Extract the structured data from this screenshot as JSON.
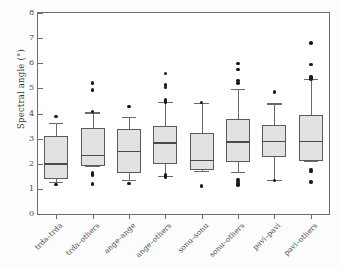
{
  "chart_data": {
    "type": "box",
    "title": "",
    "xlabel": "",
    "ylabel": "Spectral angle (°)",
    "ylim": [
      0,
      8
    ],
    "yticks": [
      0,
      1,
      2,
      3,
      4,
      5,
      6,
      7,
      8
    ],
    "ytick_labels": [
      "0",
      "1",
      "2",
      "3",
      "4",
      "5",
      "6",
      "7",
      "8"
    ],
    "grid": false,
    "legend": "none",
    "categories": [
      "trda–trda",
      "trda–others",
      "ange–ange",
      "ange–others",
      "sonu–sonu",
      "sonu–others",
      "pavi–pavi",
      "pavi–others"
    ],
    "boxes": [
      {
        "category": "trda–trda",
        "whisker_low": 1.26,
        "q1": 1.4,
        "median": 2.01,
        "q3": 3.12,
        "whisker_high": 3.64,
        "outliers": [
          3.88,
          1.17
        ]
      },
      {
        "category": "trda–others",
        "whisker_low": 1.92,
        "q1": 1.93,
        "median": 2.34,
        "q3": 3.44,
        "whisker_high": 4.04,
        "outliers": [
          5.22,
          4.93,
          4.07,
          1.66,
          1.6,
          1.55,
          1.2
        ]
      },
      {
        "category": "ange–ange",
        "whisker_low": 1.35,
        "q1": 1.62,
        "median": 2.51,
        "q3": 3.39,
        "whisker_high": 3.85,
        "outliers": [
          4.28,
          1.22
        ]
      },
      {
        "category": "ange–others",
        "whisker_low": 1.5,
        "q1": 1.98,
        "median": 2.85,
        "q3": 3.52,
        "whisker_high": 4.45,
        "outliers": [
          5.6,
          5.13,
          5.04,
          4.56,
          4.5,
          4.44,
          1.58,
          1.52,
          1.47
        ]
      },
      {
        "category": "sonu–sonu",
        "whisker_low": 1.73,
        "q1": 1.74,
        "median": 2.16,
        "q3": 3.22,
        "whisker_high": 4.42,
        "outliers": [
          4.44,
          1.11
        ]
      },
      {
        "category": "sonu–others",
        "whisker_low": 1.67,
        "q1": 2.08,
        "median": 2.89,
        "q3": 3.8,
        "whisker_high": 4.97,
        "outliers": [
          6.0,
          5.76,
          5.32,
          5.22,
          1.38,
          1.29,
          1.22,
          1.15
        ]
      },
      {
        "category": "pavi–pavi",
        "whisker_low": 1.34,
        "q1": 2.26,
        "median": 2.9,
        "q3": 3.54,
        "whisker_high": 4.4,
        "outliers": [
          4.86,
          1.34
        ]
      },
      {
        "category": "pavi–others",
        "whisker_low": 2.1,
        "q1": 2.1,
        "median": 2.9,
        "q3": 3.95,
        "whisker_high": 5.36,
        "outliers": [
          6.8,
          5.95,
          5.45,
          5.38,
          1.78,
          1.7,
          1.28
        ]
      }
    ],
    "colors": {
      "box_fill": "#e2e2e2",
      "box_edge": "#5a5a5a",
      "median": "#4a4a4a",
      "whisker": "#6a6a6a",
      "outlier": "#1a1a1a",
      "frame": "#6d6d6d",
      "background": "#ffffff"
    }
  }
}
